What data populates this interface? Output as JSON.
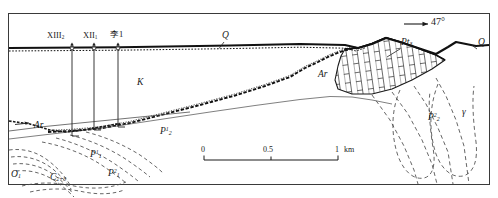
{
  "figure": {
    "type": "geological-cross-section",
    "frame": {
      "x": 8,
      "y": 13,
      "width": 482,
      "height": 172
    }
  },
  "dip": {
    "value": "47°",
    "arrow": "right-arrow"
  },
  "wells": [
    {
      "id": "well-13-2",
      "label_main": "XIII",
      "label_sub": "2",
      "x": 72,
      "top_y": 47,
      "bottom_y": 136
    },
    {
      "id": "well-12-1",
      "label_main": "XII",
      "label_sub": "1",
      "x": 94,
      "top_y": 47,
      "bottom_y": 130
    },
    {
      "id": "well-li-1",
      "label_main": "李1",
      "label_sub": "",
      "x": 118,
      "top_y": 47,
      "bottom_y": 127
    }
  ],
  "units": [
    {
      "name": "Q",
      "base": "Q",
      "sub": "",
      "sup": "",
      "x": 222,
      "y": 36,
      "note": "Quaternary - upper left"
    },
    {
      "name": "Q2",
      "base": "Q",
      "sub": "",
      "sup": "",
      "x": 478,
      "y": 43,
      "note": "Quaternary - right edge"
    },
    {
      "name": "K",
      "base": "K",
      "sub": "",
      "sup": "",
      "x": 137,
      "y": 83,
      "note": "Cretaceous"
    },
    {
      "name": "Ar-mid",
      "base": "Ar",
      "sub": "",
      "sup": "",
      "x": 318,
      "y": 75,
      "note": "Archean - middle"
    },
    {
      "name": "Ar-left",
      "base": "Ar",
      "sub": "",
      "sup": "",
      "x": 34,
      "y": 126,
      "note": "Archean - left"
    },
    {
      "name": "Pt3",
      "base": "Pt",
      "sub": "3",
      "sup": "",
      "x": 401,
      "y": 43,
      "note": "Neoproterozoic"
    },
    {
      "name": "P2-1",
      "base": "P",
      "sub": "2",
      "sup": "1",
      "x": 160,
      "y": 132,
      "note": "Lower Upper Permian"
    },
    {
      "name": "P2-2",
      "base": "P",
      "sub": "2",
      "sup": "2",
      "x": 428,
      "y": 118,
      "note": "Upper Permian"
    },
    {
      "name": "P1-1",
      "base": "P",
      "sub": "1",
      "sup": "1",
      "x": 90,
      "y": 155,
      "note": "Lower Permian 1"
    },
    {
      "name": "P1-2",
      "base": "P",
      "sub": "1",
      "sup": "2",
      "x": 108,
      "y": 174,
      "note": "Lower Permian 2"
    },
    {
      "name": "O1",
      "base": "O",
      "sub": "1",
      "sup": "",
      "x": 10,
      "y": 175,
      "note": "Lower Ordovician"
    },
    {
      "name": "C2-3",
      "base": "C",
      "sub": "2+3",
      "sup": "",
      "x": 50,
      "y": 178,
      "note": "Middle-Upper Carboniferous"
    },
    {
      "name": "gamma",
      "base": "γ",
      "sub": "",
      "sup": "",
      "x": 462,
      "y": 113,
      "note": "granite intrusion"
    }
  ],
  "scalebar": {
    "ticks": [
      "0",
      "0.5",
      "1"
    ],
    "unit": "km",
    "x0": 204,
    "x1": 338,
    "y": 158
  }
}
